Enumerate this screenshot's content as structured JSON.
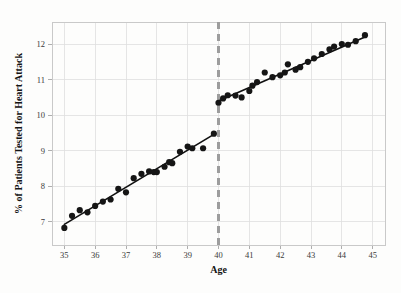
{
  "chart_data": {
    "type": "scatter",
    "title": "",
    "subtitle": "",
    "xlabel": "Age",
    "ylabel": "% of Patients Tested for Heart Attack",
    "xlim": [
      34.6,
      45.4
    ],
    "ylim": [
      6.35,
      12.62
    ],
    "x_ticks": [
      35,
      36,
      37,
      38,
      39,
      40,
      41,
      42,
      43,
      44,
      45
    ],
    "x_tick_labels": [
      "35",
      "36",
      "37",
      "38",
      "39",
      "40",
      "41",
      "42",
      "43",
      "44",
      "45"
    ],
    "y_ticks": [
      7,
      8,
      9,
      10,
      11,
      12
    ],
    "y_tick_labels": [
      "7",
      "8",
      "9",
      "10",
      "11",
      "12"
    ],
    "grid": true,
    "legend": null,
    "legend_position": "none",
    "point_color": "#151515",
    "line_color": "#111111",
    "grid_color": "#dedede",
    "cutoff": {
      "x": 40,
      "style": "dashed",
      "color": "#9d9d9d",
      "label": ""
    },
    "series": [
      {
        "name": "Below cutoff (age < 40)",
        "type": "scatter",
        "points": [
          [
            35.0,
            6.83
          ],
          [
            35.25,
            7.17
          ],
          [
            35.5,
            7.33
          ],
          [
            35.75,
            7.27
          ],
          [
            36.0,
            7.45
          ],
          [
            36.25,
            7.57
          ],
          [
            36.5,
            7.63
          ],
          [
            36.75,
            7.93
          ],
          [
            37.0,
            7.83
          ],
          [
            37.25,
            8.23
          ],
          [
            37.5,
            8.35
          ],
          [
            37.75,
            8.42
          ],
          [
            37.9,
            8.4
          ],
          [
            38.0,
            8.4
          ],
          [
            38.25,
            8.55
          ],
          [
            38.4,
            8.68
          ],
          [
            38.5,
            8.65
          ],
          [
            38.75,
            8.97
          ],
          [
            39.0,
            9.12
          ],
          [
            39.15,
            9.07
          ],
          [
            39.5,
            9.07
          ],
          [
            39.85,
            9.48
          ]
        ],
        "fit_line": {
          "x0": 35.0,
          "y0": 6.93,
          "x1": 39.85,
          "y1": 9.46
        }
      },
      {
        "name": "Above cutoff (age >= 40)",
        "type": "scatter",
        "points": [
          [
            40.0,
            10.35
          ],
          [
            40.15,
            10.47
          ],
          [
            40.3,
            10.56
          ],
          [
            40.55,
            10.55
          ],
          [
            40.75,
            10.5
          ],
          [
            41.0,
            10.68
          ],
          [
            41.1,
            10.83
          ],
          [
            41.25,
            10.93
          ],
          [
            41.5,
            11.2
          ],
          [
            41.75,
            11.07
          ],
          [
            42.0,
            11.12
          ],
          [
            42.15,
            11.2
          ],
          [
            42.25,
            11.43
          ],
          [
            42.5,
            11.28
          ],
          [
            42.65,
            11.35
          ],
          [
            42.9,
            11.5
          ],
          [
            43.1,
            11.6
          ],
          [
            43.35,
            11.72
          ],
          [
            43.6,
            11.85
          ],
          [
            43.75,
            11.93
          ],
          [
            44.0,
            12.0
          ],
          [
            44.2,
            11.98
          ],
          [
            44.45,
            12.08
          ],
          [
            44.75,
            12.25
          ]
        ],
        "fit_line": {
          "x0": 40.0,
          "y0": 10.4,
          "x1": 44.75,
          "y1": 12.2
        }
      }
    ],
    "discontinuity_jump": 0.92
  }
}
